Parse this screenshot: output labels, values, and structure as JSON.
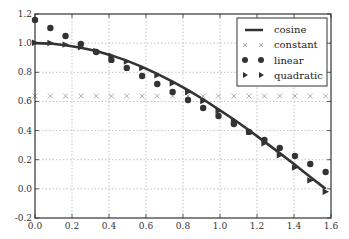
{
  "chart_data": {
    "type": "line",
    "title": "",
    "xlabel": "",
    "ylabel": "",
    "xlim": [
      0.0,
      1.6
    ],
    "ylim": [
      -0.2,
      1.2
    ],
    "grid": true,
    "legend_position": "upper right",
    "xticks": [
      "0.0",
      "0.2",
      "0.4",
      "0.6",
      "0.8",
      "1.0",
      "1.2",
      "1.4",
      "1.6"
    ],
    "yticks": [
      "-0.2",
      "0.0",
      "0.2",
      "0.4",
      "0.6",
      "0.8",
      "1.0",
      "1.2"
    ],
    "x": [
      0.0,
      0.083,
      0.165,
      0.248,
      0.331,
      0.413,
      0.496,
      0.579,
      0.661,
      0.744,
      0.827,
      0.909,
      0.992,
      1.075,
      1.157,
      1.24,
      1.323,
      1.405,
      1.488,
      1.571
    ],
    "series": [
      {
        "name": "cosine",
        "style": "line",
        "color": "#333333",
        "values": [
          1.0,
          0.997,
          0.986,
          0.969,
          0.946,
          0.916,
          0.88,
          0.837,
          0.789,
          0.736,
          0.677,
          0.615,
          0.546,
          0.476,
          0.402,
          0.324,
          0.245,
          0.165,
          0.082,
          0.0
        ]
      },
      {
        "name": "constant",
        "style": "x-marker",
        "color": "#999999",
        "values": [
          0.637,
          0.637,
          0.637,
          0.637,
          0.637,
          0.637,
          0.637,
          0.637,
          0.637,
          0.637,
          0.637,
          0.637,
          0.637,
          0.637,
          0.637,
          0.637,
          0.637,
          0.637,
          0.637,
          0.637
        ]
      },
      {
        "name": "linear",
        "style": "circle-marker",
        "color": "#333333",
        "values": [
          1.159,
          1.104,
          1.049,
          0.994,
          0.939,
          0.885,
          0.83,
          0.775,
          0.72,
          0.665,
          0.61,
          0.555,
          0.5,
          0.445,
          0.391,
          0.336,
          0.281,
          0.226,
          0.171,
          0.116
        ]
      },
      {
        "name": "quadratic",
        "style": "triangle-marker",
        "color": "#333333",
        "values": [
          1.003,
          1.001,
          0.99,
          0.972,
          0.947,
          0.914,
          0.874,
          0.829,
          0.779,
          0.724,
          0.665,
          0.602,
          0.535,
          0.465,
          0.391,
          0.313,
          0.231,
          0.146,
          0.058,
          -0.02
        ]
      }
    ]
  }
}
